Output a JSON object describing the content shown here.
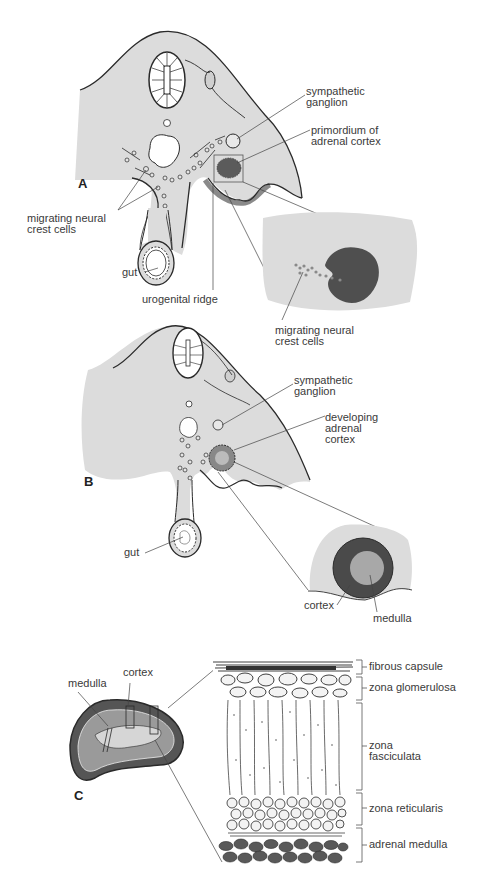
{
  "figure": {
    "panels": [
      {
        "id": "A",
        "label": "A",
        "labels": {
          "sympathetic_ganglion": "sympathetic\nganglion",
          "primordium": "primordium of\nadrenal cortex",
          "migrating_cells": "migrating neural\ncrest cells",
          "gut": "gut",
          "urogenital_ridge": "urogenital ridge",
          "inset_migrating_cells": "migrating neural\ncrest cells"
        }
      },
      {
        "id": "B",
        "label": "B",
        "labels": {
          "sympathetic_ganglion": "sympathetic\nganglion",
          "developing_cortex": "developing\nadrenal\ncortex",
          "gut": "gut",
          "cortex": "cortex",
          "medulla": "medulla"
        }
      },
      {
        "id": "C",
        "label": "C",
        "labels": {
          "medulla": "medulla",
          "cortex": "cortex",
          "zones": [
            "fibrous capsule",
            "zona glomerulosa",
            "zona\nfasciculata",
            "zona reticularis",
            "adrenal medulla"
          ]
        }
      }
    ],
    "colors": {
      "tissue_fill": "#dcdcdc",
      "outline": "#2a2a2a",
      "medulla_cells": "#555555"
    }
  }
}
